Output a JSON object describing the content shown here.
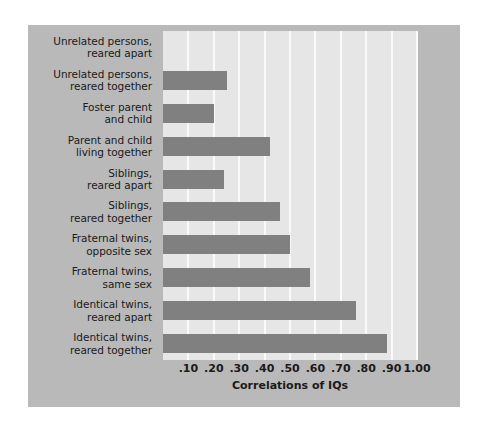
{
  "chart_data": {
    "type": "bar",
    "orientation": "horizontal",
    "title": "",
    "xlabel": "Correlations of IQs",
    "ylabel": "",
    "xlim": [
      0,
      1.0
    ],
    "xticks": [
      0.1,
      0.2,
      0.3,
      0.4,
      0.5,
      0.6,
      0.7,
      0.8,
      0.9,
      1.0
    ],
    "xtick_labels": [
      ".10",
      ".20",
      ".30",
      ".40",
      ".50",
      ".60",
      ".70",
      ".80",
      ".90",
      "1.00"
    ],
    "grid": true,
    "legend": false,
    "categories": [
      "Unrelated persons, reared apart",
      "Unrelated persons, reared together",
      "Foster parent and child",
      "Parent and child living together",
      "Siblings, reared apart",
      "Siblings, reared together",
      "Fraternal twins, opposite sex",
      "Fraternal twins, same sex",
      "Identical twins, reared apart",
      "Identical twins, reared together"
    ],
    "category_lines": [
      [
        "Unrelated persons,",
        "reared apart"
      ],
      [
        "Unrelated persons,",
        "reared together"
      ],
      [
        "Foster parent",
        "and child"
      ],
      [
        "Parent and child",
        "living together"
      ],
      [
        "Siblings,",
        "reared apart"
      ],
      [
        "Siblings,",
        "reared together"
      ],
      [
        "Fraternal twins,",
        "opposite sex"
      ],
      [
        "Fraternal twins,",
        "same sex"
      ],
      [
        "Identical twins,",
        "reared apart"
      ],
      [
        "Identical twins,",
        "reared together"
      ]
    ],
    "values": [
      0.0,
      0.25,
      0.2,
      0.42,
      0.24,
      0.46,
      0.5,
      0.58,
      0.76,
      0.88
    ]
  },
  "style": {
    "page_background": "#ffffff",
    "panel_background": "#b9b9b9",
    "plot_background": "#e6e6e6",
    "bar_color": "#808080",
    "gridline_color": "#fafafa",
    "text_color": "#1a1a1a"
  }
}
